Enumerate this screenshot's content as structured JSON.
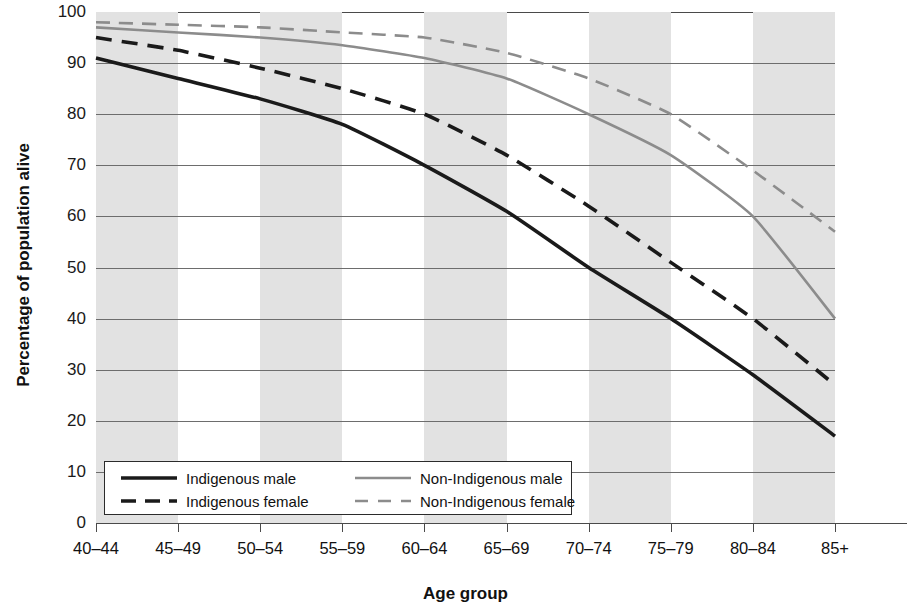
{
  "chart_data": {
    "type": "line",
    "title": "",
    "xlabel": "Age group",
    "ylabel": "Percentage of population alive",
    "categories": [
      "40–44",
      "45–49",
      "50–54",
      "55–59",
      "60–64",
      "65–69",
      "70–74",
      "75–79",
      "80–84",
      "85+"
    ],
    "ylim": [
      0,
      100
    ],
    "yticks": [
      0,
      10,
      20,
      30,
      40,
      50,
      60,
      70,
      80,
      90,
      100
    ],
    "grid": true,
    "banded_background": true,
    "legend_position": "bottom-left",
    "series": [
      {
        "name": "Indigenous male",
        "color": "#1a1a1a",
        "style": "solid",
        "values": [
          91,
          87,
          83,
          78,
          70,
          61,
          50,
          40,
          29,
          17
        ]
      },
      {
        "name": "Indigenous female",
        "color": "#1a1a1a",
        "style": "dashed",
        "values": [
          95,
          92.5,
          89,
          85,
          80,
          72,
          62,
          51,
          40,
          27
        ]
      },
      {
        "name": "Non-Indigenous male",
        "color": "#8c8c8c",
        "style": "solid",
        "values": [
          97,
          96,
          95,
          93.5,
          91,
          87,
          80,
          72,
          60,
          40
        ]
      },
      {
        "name": "Non-Indigenous female",
        "color": "#8c8c8c",
        "style": "dashed",
        "values": [
          98,
          97.5,
          97,
          96,
          95,
          92,
          87,
          80,
          69,
          57
        ]
      }
    ]
  },
  "axis": {
    "y_title": "Percentage of population alive",
    "x_title": "Age group",
    "y_tick_labels": [
      "100",
      "90",
      "80",
      "70",
      "60",
      "50",
      "40",
      "30",
      "20",
      "10",
      "0"
    ],
    "x_tick_labels": [
      "40–44",
      "45–49",
      "50–54",
      "55–59",
      "60–64",
      "65–69",
      "70–74",
      "75–79",
      "80–84",
      "85+"
    ]
  },
  "legend": {
    "entries": [
      {
        "label": "Indigenous male",
        "color": "#1a1a1a",
        "style": "solid"
      },
      {
        "label": "Indigenous female",
        "color": "#1a1a1a",
        "style": "dashed"
      },
      {
        "label": "Non-Indigenous male",
        "color": "#8c8c8c",
        "style": "solid"
      },
      {
        "label": "Non-Indigenous female",
        "color": "#8c8c8c",
        "style": "dashed"
      }
    ]
  },
  "colors": {
    "band": "#e2e2e2",
    "gridline": "#6d6d6d",
    "axis": "#2b2b2b",
    "indigenous": "#1a1a1a",
    "non_indigenous": "#8c8c8c",
    "background": "#ffffff"
  }
}
